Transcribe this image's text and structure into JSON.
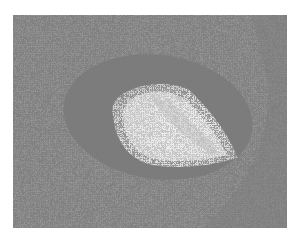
{
  "image": {
    "description": "Grayscale histology micrograph: vessel lumen surrounded by thick eosinophilic wall within densely cellular tissue",
    "alt": "Histology micrograph of a blood vessel cross-section",
    "colors": {
      "background": "#ffffff",
      "tissue": "#8e8e8e",
      "vessel_wall": "#7a7a7a",
      "lumen": "#e4e4e4",
      "nuclei": "#3a3a3a"
    }
  }
}
